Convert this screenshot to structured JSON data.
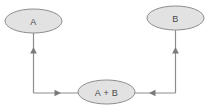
{
  "diagram": {
    "type": "flow-cycle",
    "background_color": "#ffffff",
    "node_fill_color": "#e2e2e2",
    "node_stroke_color": "#8d8d8d",
    "edge_color": "#8d8d8d",
    "arrow_color": "#7a7a7a",
    "label_color": "#4a4a4a",
    "nodes": [
      {
        "id": "a",
        "label": "A",
        "cx": 33.5,
        "cy": 21,
        "rx": 28.5,
        "ry": 12
      },
      {
        "id": "b",
        "label": "B",
        "cx": 175.5,
        "cy": 18,
        "rx": 28.5,
        "ry": 12
      },
      {
        "id": "ab",
        "label": "A + B",
        "cx": 106.5,
        "cy": 92,
        "rx": 28.5,
        "ry": 12
      }
    ],
    "edges": [
      {
        "id": "ab-to-a",
        "from": "ab",
        "to": "a",
        "arrow_direction": "up",
        "path": "M 33.5 93 L 33.5 33"
      },
      {
        "id": "ab-to-b",
        "from": "ab",
        "to": "b",
        "arrow_direction": "up",
        "path": "M 175.5 93 L 175.5 30"
      },
      {
        "id": "left-to-ab",
        "from": "a",
        "to": "ab",
        "arrow_direction": "right",
        "path": "M 33.5 93 L 78 93"
      },
      {
        "id": "right-to-ab",
        "from": "b",
        "to": "ab",
        "arrow_direction": "left",
        "path": "M 175.5 93 L 135 93"
      }
    ],
    "arrowheads": [
      {
        "id": "head-a",
        "direction": "up",
        "x": 33.5,
        "y": 50
      },
      {
        "id": "head-b",
        "direction": "up",
        "x": 175.5,
        "y": 50
      },
      {
        "id": "head-ab-left",
        "direction": "right",
        "x": 58,
        "y": 93
      },
      {
        "id": "head-ab-right",
        "direction": "left",
        "x": 152,
        "y": 93
      }
    ]
  }
}
